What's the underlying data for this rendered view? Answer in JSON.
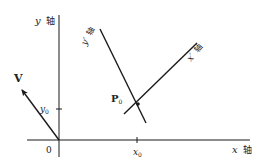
{
  "diagram": {
    "type": "coordinate-rotation",
    "colors": {
      "line": "#1a1a1a",
      "text": "#222222",
      "background": "#ffffff"
    },
    "axes": {
      "x_label": "x",
      "x_suffix": "轴",
      "y_label": "y",
      "y_suffix": "轴",
      "origin_label": "0"
    },
    "rotated_axes": {
      "x_prime_label": "x′",
      "x_prime_suffix": "轴",
      "y_prime_label": "y′",
      "y_prime_suffix": "轴"
    },
    "ticks": {
      "x0": "x",
      "x0_sub": "0",
      "y0": "y",
      "y0_sub": "0"
    },
    "point": {
      "label": "P",
      "sub": "0"
    },
    "vector": {
      "label": "V"
    }
  }
}
